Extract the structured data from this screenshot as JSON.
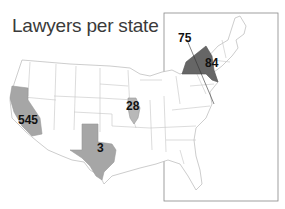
{
  "title": "Lawyers per state",
  "colors": {
    "background": "#ffffff",
    "state_border": "#b8b8b8",
    "highlight_light": "#a6a6a6",
    "highlight_dark": "#666666",
    "inset_border": "#888888"
  },
  "labels": {
    "california": "545",
    "texas": "3",
    "illinois": "28",
    "new_york": "84",
    "dc": "75"
  },
  "map_data": [
    {
      "state": "California",
      "value": 545,
      "shade": "light"
    },
    {
      "state": "Texas",
      "value": 3,
      "shade": "light"
    },
    {
      "state": "Illinois",
      "value": 28,
      "shade": "light"
    },
    {
      "state": "New York",
      "value": 84,
      "shade": "dark"
    },
    {
      "state": "District of Columbia",
      "value": 75,
      "shade": "leader-line"
    }
  ]
}
